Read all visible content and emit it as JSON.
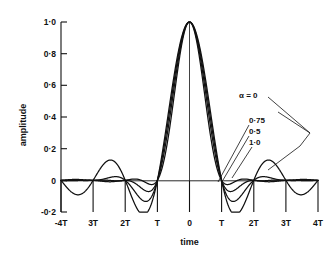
{
  "chart_data": {
    "type": "line",
    "title": "",
    "xlabel": "time",
    "ylabel": "amplitude",
    "xlim": [
      -4,
      4
    ],
    "ylim": [
      -0.2,
      1.0
    ],
    "grid": false,
    "legend_position": "inside-right",
    "x_tick_labels": [
      "-4T",
      "3T",
      "2T",
      "T",
      "0",
      "T",
      "2T",
      "3T",
      "4T"
    ],
    "x_tick_values": [
      -4,
      -3,
      -2,
      -1,
      0,
      1,
      2,
      3,
      4
    ],
    "y_tick_labels": [
      "1·0",
      "0·8",
      "0·6",
      "0·4",
      "0·2",
      "0",
      "-0·2"
    ],
    "y_tick_values": [
      1.0,
      0.8,
      0.6,
      0.4,
      0.2,
      0.0,
      -0.2
    ],
    "annotations": [
      {
        "name": "alpha-0",
        "text": "α = 0"
      },
      {
        "name": "alpha-075",
        "text": "0·75"
      },
      {
        "name": "alpha-05",
        "text": "0·5"
      },
      {
        "name": "alpha-10",
        "text": "1·0"
      }
    ],
    "series": [
      {
        "name": "α = 0",
        "alpha": 0,
        "color": "#111111",
        "x": [
          -4,
          -3.9,
          -3.8,
          -3.7,
          -3.6,
          -3.5,
          -3.4,
          -3.3,
          -3.2,
          -3.1,
          -3,
          -2.9,
          -2.8,
          -2.7,
          -2.6,
          -2.5,
          -2.4,
          -2.3,
          -2.2,
          -2.1,
          -2,
          -1.9,
          -1.8,
          -1.7,
          -1.6,
          -1.5,
          -1.4,
          -1.3,
          -1.2,
          -1.1,
          -1,
          -0.9,
          -0.8,
          -0.7,
          -0.6,
          -0.5,
          -0.4,
          -0.3,
          -0.2,
          -0.1,
          0,
          0.1,
          0.2,
          0.3,
          0.4,
          0.5,
          0.6,
          0.7,
          0.8,
          0.9,
          1,
          1.1,
          1.2,
          1.3,
          1.4,
          1.5,
          1.6,
          1.7,
          1.8,
          1.9,
          2,
          2.1,
          2.2,
          2.3,
          2.4,
          2.5,
          2.6,
          2.7,
          2.8,
          2.9,
          3,
          3.1,
          3.2,
          3.3,
          3.4,
          3.5,
          3.6,
          3.7,
          3.8,
          3.9,
          4
        ],
        "y": [
          0,
          0.0253,
          0.0491,
          0.0699,
          0.0865,
          0.0979,
          0.1033,
          0.1025,
          0.0955,
          0.0827,
          0.0649,
          0.0433,
          0.0191,
          -0.0059,
          -0.0302,
          -0.052,
          -0.07,
          -0.0828,
          -0.0895,
          -0.0894,
          -0.0827,
          -0.0695,
          -0.0507,
          -0.0275,
          -0.0014,
          0.0258,
          0.0525,
          0.0769,
          0.0976,
          0.1131,
          0.1225,
          0.1247,
          0.1194,
          0.1062,
          0.0852,
          0.0569,
          0.022,
          -0.0186,
          -0.0635,
          -0.1113,
          0,
          0.9836,
          0.9355,
          0.8584,
          0.7568,
          0.6366,
          0.5046,
          0.3679,
          0.2338,
          0.109,
          0,
          -0.0858,
          -0.1484,
          -0.1862,
          -0.1993,
          -0.1891,
          -0.158,
          -0.1093,
          -0.0472,
          0.0236,
          0,
          0.0236,
          -0.0472,
          -0.1093,
          -0.158,
          -0.1891,
          -0.1993,
          -0.1862,
          -0.1484,
          -0.0858,
          0,
          0.109,
          0.2338,
          0.3679,
          0.5046,
          0.6366,
          0.7568,
          0.8584,
          0.9355,
          0.9836,
          0
        ],
        "note": "sinc(t/T) - largest sidelobes, deepest trough about -0.2"
      },
      {
        "name": "0·5",
        "alpha": 0.5,
        "color": "#111111",
        "note": "raised cosine rolloff 0.5 - moderate sidelobes"
      },
      {
        "name": "0·75",
        "alpha": 0.75,
        "color": "#111111",
        "note": "raised cosine rolloff 0.75 - small sidelobes"
      },
      {
        "name": "1·0",
        "alpha": 1.0,
        "color": "#111111",
        "note": "raised cosine rolloff 1.0 - smallest sidelobes"
      }
    ]
  },
  "axes": {
    "y_title": "amplitude",
    "x_title": "time"
  }
}
